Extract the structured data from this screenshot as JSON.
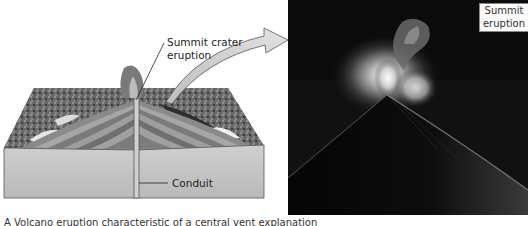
{
  "figure": {
    "diagram": {
      "title": "Volcano cross-section diagram",
      "labels": {
        "summit_crater": "Summit crater eruption",
        "summit_crater_line1": "Summit crater",
        "summit_crater_line2": "eruption",
        "conduit": "Conduit"
      },
      "arrow_icon": "curved-arrow-icon"
    },
    "photo": {
      "description": "Night photograph of stratovolcano erupting from summit",
      "label_line1": "Summit",
      "label_line2": "eruption"
    },
    "caption": "A  Volcano eruption characteristic of a central vent explanation"
  },
  "colors": {
    "photo_background": "#0a0a0a",
    "block_face": "#c4c4c4",
    "strata_light": "#9a9a9a",
    "strata_dark": "#6e6e6e",
    "arrow_fill": "#d6d6d6",
    "label_text": "#222222"
  }
}
